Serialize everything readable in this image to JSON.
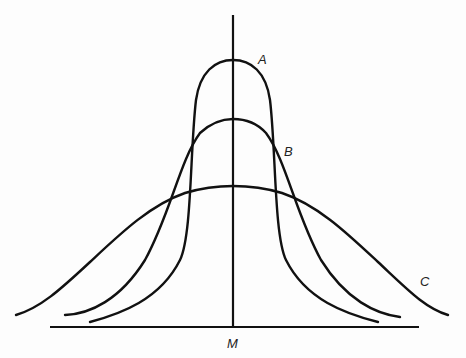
{
  "diagram": {
    "type": "overlapping normal distribution curves sharing a common mean",
    "curves": [
      {
        "id": "A",
        "label": "A",
        "description": "narrow, tall curve (small dispersion)"
      },
      {
        "id": "B",
        "label": "B",
        "description": "medium-width curve"
      },
      {
        "id": "C",
        "label": "C",
        "description": "wide, flat curve (large dispersion)"
      }
    ],
    "mean_label": "M",
    "colors": {
      "stroke": "#111111",
      "background": "#fdfdfd",
      "text": "#222222"
    }
  }
}
